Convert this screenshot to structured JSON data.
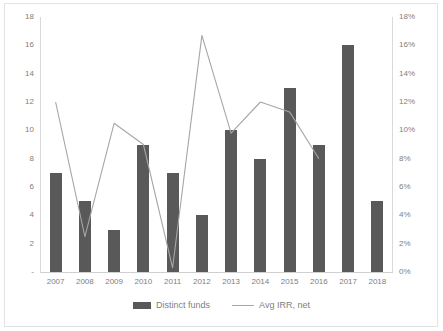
{
  "chart_data": {
    "type": "bar",
    "title": "",
    "subtitle": "",
    "xlabel": "",
    "ylabel": "",
    "y2label": "",
    "grid": false,
    "legend_position": "bottom",
    "categories": [
      "2007",
      "2008",
      "2009",
      "2010",
      "2011",
      "2012",
      "2013",
      "2014",
      "2015",
      "2016",
      "2017",
      "2018"
    ],
    "series": [
      {
        "name": "Distinct funds",
        "type": "bar",
        "axis": "left",
        "color": "#595959",
        "values": [
          7,
          5,
          3,
          9,
          7,
          4,
          10,
          8,
          13,
          9,
          16,
          5
        ]
      },
      {
        "name": "Avg IRR, net",
        "type": "line",
        "axis": "right",
        "color": "#a6a6a6",
        "values": [
          0.12,
          0.025,
          0.105,
          0.09,
          0.003,
          0.167,
          0.098,
          0.12,
          0.113,
          0.08,
          null,
          null
        ]
      }
    ],
    "ylim": [
      0,
      18
    ],
    "y2lim": [
      0,
      0.18
    ],
    "yticks": [
      "-",
      "2",
      "4",
      "6",
      "8",
      "10",
      "12",
      "14",
      "16",
      "18"
    ],
    "ytick_values": [
      0,
      2,
      4,
      6,
      8,
      10,
      12,
      14,
      16,
      18
    ],
    "y2ticks": [
      "0%",
      "2%",
      "4%",
      "6%",
      "8%",
      "10%",
      "12%",
      "14%",
      "16%",
      "18%"
    ],
    "y2tick_values": [
      0,
      0.02,
      0.04,
      0.06,
      0.08,
      0.1,
      0.12,
      0.14,
      0.16,
      0.18
    ]
  },
  "legend": {
    "items": [
      {
        "label": "Distinct funds",
        "marker": "bar-swatch-icon"
      },
      {
        "label": "Avg IRR, net",
        "marker": "line-swatch-icon"
      }
    ]
  },
  "colors": {
    "bar": "#595959",
    "line": "#a6a6a6",
    "axis_text": "#808080",
    "frame": "#e3e3e3",
    "background": "#ffffff"
  }
}
